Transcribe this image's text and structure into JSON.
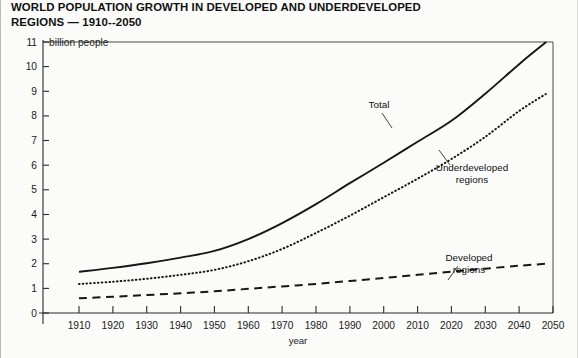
{
  "title": "WORLD POPULATION GROWTH IN DEVELOPED AND UNDERDEVELOPED\nREGIONS — 1910--2050",
  "axes": {
    "y_unit_label": "billion people",
    "x_axis_title": "year"
  },
  "annotations": {
    "total": "Total",
    "underdeveloped_line1": "Underdeveloped",
    "underdeveloped_line2": "regions",
    "developed_line1": "Developed",
    "developed_line2": "regions"
  },
  "colors": {
    "ink": "#161616",
    "background": "#fbfbfa",
    "axis": "#2b2b2b"
  },
  "chart_data": {
    "type": "line",
    "title": "WORLD POPULATION GROWTH IN DEVELOPED AND UNDERDEVELOPED REGIONS — 1910--2050",
    "xlabel": "year",
    "ylabel": "billion people",
    "xlim": [
      1905,
      2052
    ],
    "ylim": [
      0,
      11
    ],
    "grid": false,
    "legend_position": "inline-annotations",
    "x_ticks": [
      1910,
      1920,
      1930,
      1940,
      1950,
      1960,
      1970,
      1980,
      1990,
      2000,
      2010,
      2020,
      2030,
      2040,
      2050
    ],
    "y_ticks": [
      0,
      1,
      2,
      3,
      4,
      5,
      6,
      7,
      8,
      9,
      10,
      11
    ],
    "x": [
      1910,
      1920,
      1930,
      1940,
      1950,
      1960,
      1970,
      1980,
      1990,
      2000,
      2010,
      2020,
      2030,
      2040,
      2048
    ],
    "series": [
      {
        "name": "Total",
        "style": "solid",
        "values": [
          1.67,
          1.83,
          2.02,
          2.25,
          2.52,
          3.0,
          3.65,
          4.42,
          5.27,
          6.1,
          6.95,
          7.8,
          8.9,
          10.1,
          11.0
        ]
      },
      {
        "name": "Underdeveloped regions",
        "style": "dotted",
        "values": [
          1.18,
          1.27,
          1.39,
          1.55,
          1.75,
          2.1,
          2.6,
          3.25,
          3.95,
          4.7,
          5.45,
          6.25,
          7.15,
          8.2,
          8.9
        ]
      },
      {
        "name": "Developed regions",
        "style": "dashed",
        "values": [
          0.6,
          0.66,
          0.73,
          0.8,
          0.88,
          0.98,
          1.08,
          1.18,
          1.3,
          1.42,
          1.55,
          1.68,
          1.8,
          1.92,
          2.0
        ]
      }
    ]
  }
}
